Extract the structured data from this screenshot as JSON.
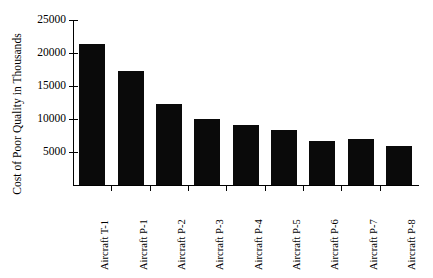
{
  "chart_data": {
    "type": "bar",
    "title": "",
    "xlabel": "",
    "ylabel": "Cost of Poor Quality in Thousands",
    "ylim": [
      0,
      25000
    ],
    "ytick_values": [
      5000,
      10000,
      15000,
      20000,
      25000
    ],
    "ytick_labels": [
      "5000",
      "10000",
      "15000",
      "20000",
      "25000"
    ],
    "grid": false,
    "legend": null,
    "bar_color": "#0a0a0a",
    "axis_color": "#000000",
    "categories": [
      "Aircraft T-1",
      "Aircraft P-1",
      "Aircraft P-2",
      "Aircraft P-3",
      "Aircraft P-4",
      "Aircraft P-5",
      "Aircraft P-6",
      "Aircraft P-7",
      "Aircraft P-8"
    ],
    "values": [
      21400,
      17300,
      12300,
      10000,
      9100,
      8400,
      6600,
      7000,
      5900
    ]
  }
}
